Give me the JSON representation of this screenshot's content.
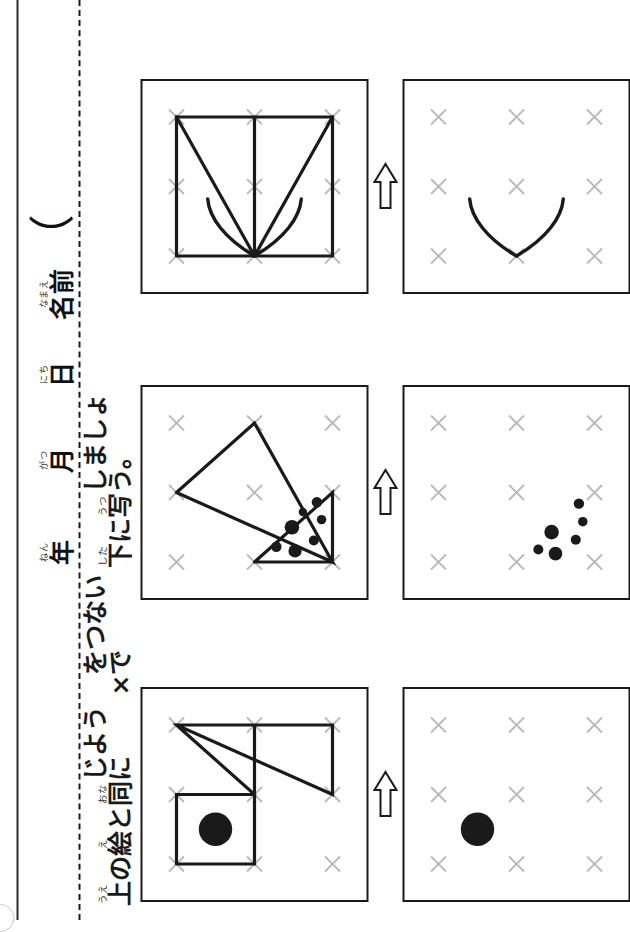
{
  "worksheet": {
    "title": "点つなぎ 写し取りプリント",
    "page_border_color": "#2b2b2b",
    "separator_style": "dashed",
    "x_mark_color": "#b9b9b9",
    "line_color": "#1a1a1a",
    "corner_mark": "circle-mark"
  },
  "header": {
    "fields": [
      {
        "ruby": "ねん",
        "kanji": "年"
      },
      {
        "ruby": "がつ",
        "kanji": "月"
      },
      {
        "ruby": "にち",
        "kanji": "日"
      },
      {
        "ruby": "なまえ",
        "kanji": "名前"
      }
    ],
    "name_paren": "（"
  },
  "instruction": {
    "full_text": "上の絵と同じように × をつないで下に写しましょう。",
    "segments": [
      {
        "ruby": "うえ",
        "text": "上"
      },
      {
        "ruby": "",
        "text": "の"
      },
      {
        "ruby": "え",
        "text": "絵"
      },
      {
        "ruby": "",
        "text": "と"
      },
      {
        "ruby": "おな",
        "text": "同"
      },
      {
        "ruby": "",
        "text": "じように "
      },
      {
        "ruby": "",
        "text": "×"
      },
      {
        "ruby": "",
        "text": " をつないで"
      },
      {
        "ruby": "した",
        "text": "下"
      },
      {
        "ruby": "",
        "text": "に"
      },
      {
        "ruby": "うつ",
        "text": "写"
      },
      {
        "ruby": "",
        "text": "しましょう。"
      }
    ]
  },
  "arrow": {
    "glyph": "hollow-right-arrow",
    "label": "下へ写す"
  },
  "grid": {
    "rows": 3,
    "cols": 3,
    "mark": "×",
    "mark_label": "x-mark"
  },
  "puzzles": [
    {
      "id": "puzzle-1",
      "name": "square-with-dot-and-zigzag",
      "model": {
        "shapes": [
          {
            "type": "polyline",
            "name": "square-outline",
            "points": "0,0 1,0 1,1 0,1 0,0"
          },
          {
            "type": "polyline",
            "name": "zigzag-triangle",
            "points": "2,0 1,2 2,2 2,0 1,1 2,1"
          },
          {
            "type": "dot",
            "name": "large-dot",
            "cx": 0.5,
            "cy": 0.5,
            "r": 0.24
          }
        ]
      },
      "answer": {
        "shapes": [
          {
            "type": "dot",
            "name": "large-dot",
            "cx": 0.5,
            "cy": 0.5,
            "r": 0.24
          }
        ]
      }
    },
    {
      "id": "puzzle-2",
      "name": "two-triangles-with-seven-dots",
      "model": {
        "shapes": [
          {
            "type": "polyline",
            "name": "small-triangle",
            "points": "0,1 0,2 1,2 0,1"
          },
          {
            "type": "polyline",
            "name": "large-triangle",
            "points": "1,0 2,1 0,2 1,0"
          },
          {
            "type": "dot",
            "name": "dot",
            "cx": 0.22,
            "cy": 1.28,
            "r": 0.075
          },
          {
            "type": "dot",
            "name": "dot",
            "cx": 0.16,
            "cy": 1.52,
            "r": 0.095
          },
          {
            "type": "dot",
            "name": "dot",
            "cx": 0.5,
            "cy": 1.48,
            "r": 0.105
          },
          {
            "type": "dot",
            "name": "dot",
            "cx": 0.31,
            "cy": 1.76,
            "r": 0.072
          },
          {
            "type": "dot",
            "name": "dot",
            "cx": 0.61,
            "cy": 1.86,
            "r": 0.068
          },
          {
            "type": "dot",
            "name": "dot",
            "cx": 0.86,
            "cy": 1.8,
            "r": 0.075
          },
          {
            "type": "dot",
            "name": "dot",
            "cx": 0.72,
            "cy": 1.62,
            "r": 0.06
          }
        ]
      },
      "answer": {
        "shapes": [
          {
            "type": "dot",
            "name": "dot",
            "cx": 0.18,
            "cy": 1.28,
            "r": 0.072
          },
          {
            "type": "dot",
            "name": "dot",
            "cx": 0.12,
            "cy": 1.5,
            "r": 0.098
          },
          {
            "type": "dot",
            "name": "dot",
            "cx": 0.43,
            "cy": 1.45,
            "r": 0.105
          },
          {
            "type": "dot",
            "name": "dot",
            "cx": 0.32,
            "cy": 1.76,
            "r": 0.072
          },
          {
            "type": "dot",
            "name": "dot",
            "cx": 0.58,
            "cy": 1.85,
            "r": 0.068
          },
          {
            "type": "dot",
            "name": "dot",
            "cx": 0.84,
            "cy": 1.8,
            "r": 0.075
          }
        ]
      }
    },
    {
      "id": "puzzle-3",
      "name": "starburst-with-two-curves",
      "model": {
        "shapes": [
          {
            "type": "polyline",
            "name": "rectangle-outline",
            "points": "0,0 2,0 2,2 0,2 0,0"
          },
          {
            "type": "polyline",
            "name": "ray-up-right",
            "points": "0,1 2,0"
          },
          {
            "type": "polyline",
            "name": "ray-right",
            "points": "0,1 2,1"
          },
          {
            "type": "polyline",
            "name": "ray-down-right",
            "points": "0,1 2,2"
          },
          {
            "type": "curve",
            "name": "upper-curve",
            "path": "M 0,1 C 0.25,0.62 0.55,0.42 0.82,0.40"
          },
          {
            "type": "curve",
            "name": "lower-curve",
            "path": "M 0,1 C 0.25,1.38 0.55,1.58 0.82,1.60"
          }
        ]
      },
      "answer": {
        "shapes": [
          {
            "type": "curve",
            "name": "upper-curve",
            "path": "M 0,1 C 0.25,0.62 0.55,0.42 0.82,0.40"
          },
          {
            "type": "curve",
            "name": "lower-curve",
            "path": "M 0,1 C 0.25,1.38 0.55,1.58 0.82,1.60"
          }
        ]
      }
    }
  ]
}
